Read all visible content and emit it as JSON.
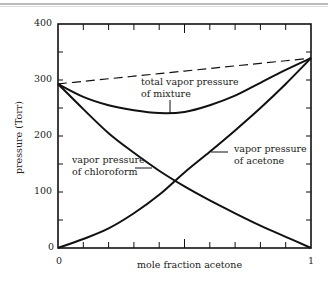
{
  "chart_data": {
    "type": "line",
    "title": "",
    "xlabel": "mole fraction acetone",
    "ylabel": "pressure (Torr)",
    "xlim": [
      0,
      1
    ],
    "ylim": [
      0,
      400
    ],
    "x_ticks": [
      "0",
      "1"
    ],
    "y_ticks": [
      "0",
      "100",
      "200",
      "300",
      "400"
    ],
    "grid": false,
    "legend": "none (inline annotations)",
    "x": [
      0,
      0.1,
      0.2,
      0.3,
      0.4,
      0.5,
      0.6,
      0.7,
      0.8,
      0.9,
      1.0
    ],
    "series": [
      {
        "name": "vapor pressure of chloroform",
        "style": "solid",
        "values": [
          293,
          248,
          205,
          170,
          138,
          110,
          85,
          62,
          40,
          20,
          0
        ]
      },
      {
        "name": "vapor pressure of acetone",
        "style": "solid",
        "values": [
          0,
          16,
          35,
          62,
          95,
          135,
          172,
          210,
          250,
          293,
          339
        ]
      },
      {
        "name": "total vapor pressure of mixture",
        "style": "solid",
        "values": [
          293,
          270,
          255,
          246,
          241,
          243,
          255,
          272,
          295,
          318,
          339
        ]
      },
      {
        "name": "ideal (Raoult's law) total",
        "style": "dashed",
        "values": [
          293,
          297.6,
          302.2,
          306.8,
          311.4,
          316,
          320.6,
          325.2,
          329.8,
          334.4,
          339
        ]
      }
    ],
    "annotations": [
      "total vapor pressure of mixture",
      "vapor pressure of chloroform",
      "vapor pressure of acetone"
    ]
  },
  "labels": {
    "y400": "400",
    "y300": "300",
    "y200": "200",
    "y100": "100",
    "y0": "0",
    "x0": "0",
    "x1": "1",
    "xlabel": "mole fraction acetone",
    "ylabel": "pressure (Torr)",
    "total_1": "total vapor pressure",
    "total_2": "of mixture",
    "chloro_1": "vapor pressure",
    "chloro_2": "of chloroform",
    "acetone_1": "vapor pressure",
    "acetone_2": "of acetone"
  }
}
